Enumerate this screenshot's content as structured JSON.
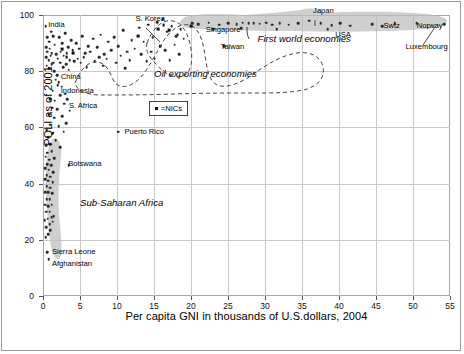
{
  "chart_data": {
    "type": "scatter",
    "title": "",
    "xlabel": "Per capita GNI in thousands of U.S.dollars, 2004",
    "ylabel": "PQLI as of 2001",
    "xlim": [
      0,
      55
    ],
    "ylim": [
      0,
      100
    ],
    "xticks": [
      0,
      5,
      10,
      15,
      20,
      25,
      30,
      35,
      40,
      45,
      50,
      55
    ],
    "yticks": [
      0,
      20,
      40,
      60,
      80,
      100
    ],
    "xticklabels": [
      "0",
      "5",
      "10",
      "15",
      "20",
      "25",
      "30",
      "35",
      "40",
      "45",
      "50",
      "55"
    ],
    "yticklabels": [
      "0",
      "20",
      "40",
      "60",
      "80",
      "100"
    ],
    "grid": true,
    "legend": {
      "position": "inside-center-left",
      "entries": [
        {
          "marker": "square",
          "label": "=NICs"
        }
      ]
    },
    "point_color": "#2a2a2a",
    "grid_color": "#c9c9c9",
    "blob_color": "#bdbdbd",
    "annotations": [
      {
        "text": "India",
        "x": 0.7,
        "y": 96.5
      },
      {
        "text": "S. Korea",
        "x": 12.5,
        "y": 98.5
      },
      {
        "text": "Japan",
        "x": 36.5,
        "y": 101.5
      },
      {
        "text": "Singapore",
        "x": 22.0,
        "y": 94.5
      },
      {
        "text": "USA",
        "x": 39.5,
        "y": 93.0
      },
      {
        "text": "Swtz",
        "x": 46.0,
        "y": 96.0
      },
      {
        "text": "Norway",
        "x": 50.5,
        "y": 96.0
      },
      {
        "text": "Taiwan",
        "x": 24.0,
        "y": 88.5
      },
      {
        "text": "Luxembourg",
        "x": 49.0,
        "y": 88.5
      },
      {
        "text": "China",
        "x": 2.4,
        "y": 78.0
      },
      {
        "text": "Indonesia",
        "x": 2.4,
        "y": 73.0
      },
      {
        "text": "S. Africa",
        "x": 3.5,
        "y": 67.5
      },
      {
        "text": "Puerto Rico",
        "x": 11.0,
        "y": 58.5
      },
      {
        "text": "Botswana",
        "x": 3.4,
        "y": 47.0
      },
      {
        "text": "Sierra Leone",
        "x": 1.2,
        "y": 15.5
      },
      {
        "text": "Afghanistan",
        "x": 1.2,
        "y": 11.5
      }
    ],
    "region_labels": [
      {
        "text": "First world economies",
        "x": 29.0,
        "y": 91.5
      },
      {
        "text": "Oil exporting economies",
        "x": 15.0,
        "y": 79.0
      },
      {
        "text": "Sub-Saharan Africa",
        "x": 5.0,
        "y": 33.0
      }
    ],
    "series": [
      {
        "name": "Countries",
        "points": [
          [
            0.35,
            96.0
          ],
          [
            0.55,
            92.0
          ],
          [
            0.8,
            90.5
          ],
          [
            1.1,
            94.0
          ],
          [
            1.4,
            92.5
          ],
          [
            0.4,
            88.5
          ],
          [
            0.6,
            87.0
          ],
          [
            0.9,
            88.0
          ],
          [
            1.2,
            86.5
          ],
          [
            1.6,
            89.5
          ],
          [
            0.45,
            85.0
          ],
          [
            0.75,
            84.0
          ],
          [
            1.05,
            85.5
          ],
          [
            1.35,
            83.0
          ],
          [
            1.8,
            86.0
          ],
          [
            0.5,
            82.0
          ],
          [
            0.85,
            81.0
          ],
          [
            1.15,
            82.5
          ],
          [
            1.5,
            80.0
          ],
          [
            2.0,
            84.5
          ],
          [
            2.2,
            92.0
          ],
          [
            2.6,
            90.0
          ],
          [
            3.0,
            93.5
          ],
          [
            3.4,
            88.5
          ],
          [
            3.8,
            91.0
          ],
          [
            2.4,
            87.0
          ],
          [
            2.8,
            85.5
          ],
          [
            3.2,
            86.5
          ],
          [
            3.6,
            84.0
          ],
          [
            4.0,
            87.5
          ],
          [
            2.3,
            83.0
          ],
          [
            2.7,
            81.5
          ],
          [
            3.1,
            82.5
          ],
          [
            3.5,
            80.5
          ],
          [
            4.2,
            83.5
          ],
          [
            4.5,
            90.0
          ],
          [
            4.9,
            88.0
          ],
          [
            5.3,
            92.5
          ],
          [
            5.7,
            86.5
          ],
          [
            6.1,
            89.0
          ],
          [
            4.7,
            84.5
          ],
          [
            5.1,
            83.0
          ],
          [
            5.5,
            85.0
          ],
          [
            5.9,
            81.5
          ],
          [
            6.4,
            87.0
          ],
          [
            6.8,
            91.5
          ],
          [
            7.3,
            88.5
          ],
          [
            7.8,
            93.0
          ],
          [
            8.3,
            86.0
          ],
          [
            8.8,
            90.5
          ],
          [
            7.0,
            83.5
          ],
          [
            7.6,
            85.0
          ],
          [
            8.1,
            82.0
          ],
          [
            8.6,
            84.5
          ],
          [
            9.2,
            87.5
          ],
          [
            9.6,
            92.0
          ],
          [
            10.2,
            89.0
          ],
          [
            10.8,
            94.5
          ],
          [
            11.4,
            87.0
          ],
          [
            12.0,
            91.0
          ],
          [
            9.9,
            83.0
          ],
          [
            10.5,
            85.5
          ],
          [
            11.1,
            81.0
          ],
          [
            11.7,
            84.0
          ],
          [
            12.4,
            88.0
          ],
          [
            13.0,
            95.5
          ],
          [
            13.6,
            90.5
          ],
          [
            14.2,
            96.5
          ],
          [
            14.8,
            92.0
          ],
          [
            15.4,
            97.5
          ],
          [
            13.3,
            86.0
          ],
          [
            14.0,
            83.5
          ],
          [
            14.6,
            87.0
          ],
          [
            15.1,
            84.5
          ],
          [
            15.8,
            89.0
          ],
          [
            16.2,
            98.5
          ],
          [
            16.8,
            94.0
          ],
          [
            17.4,
            96.0
          ],
          [
            18.0,
            92.5
          ],
          [
            18.6,
            95.0
          ],
          [
            16.5,
            87.5
          ],
          [
            17.1,
            84.0
          ],
          [
            17.8,
            89.5
          ],
          [
            18.4,
            86.0
          ],
          [
            19.0,
            91.5
          ],
          [
            1.9,
            78.5
          ],
          [
            2.1,
            76.0
          ],
          [
            2.5,
            74.5
          ],
          [
            3.0,
            72.0
          ],
          [
            3.3,
            70.0
          ],
          [
            1.7,
            77.0
          ],
          [
            2.0,
            75.0
          ],
          [
            2.3,
            71.5
          ],
          [
            2.9,
            68.5
          ],
          [
            3.6,
            66.0
          ],
          [
            1.3,
            73.0
          ],
          [
            1.6,
            69.5
          ],
          [
            1.9,
            66.5
          ],
          [
            2.6,
            64.0
          ],
          [
            3.1,
            61.5
          ],
          [
            1.0,
            70.0
          ],
          [
            1.25,
            67.0
          ],
          [
            1.55,
            63.5
          ],
          [
            2.1,
            60.5
          ],
          [
            2.8,
            58.5
          ],
          [
            0.8,
            64.5
          ],
          [
            1.0,
            61.0
          ],
          [
            1.3,
            58.0
          ],
          [
            1.7,
            55.5
          ],
          [
            2.3,
            53.0
          ],
          [
            0.5,
            59.0
          ],
          [
            0.7,
            56.5
          ],
          [
            0.95,
            54.0
          ],
          [
            1.2,
            51.5
          ],
          [
            1.5,
            49.0
          ],
          [
            0.4,
            53.5
          ],
          [
            0.6,
            51.0
          ],
          [
            0.85,
            48.5
          ],
          [
            1.1,
            46.5
          ],
          [
            1.4,
            44.0
          ],
          [
            0.35,
            49.5
          ],
          [
            0.55,
            47.0
          ],
          [
            0.75,
            45.0
          ],
          [
            1.0,
            42.5
          ],
          [
            1.3,
            40.5
          ],
          [
            0.3,
            45.5
          ],
          [
            0.5,
            43.0
          ],
          [
            0.7,
            41.0
          ],
          [
            0.95,
            38.5
          ],
          [
            1.25,
            36.5
          ],
          [
            0.3,
            41.5
          ],
          [
            0.5,
            39.0
          ],
          [
            0.7,
            37.0
          ],
          [
            0.9,
            34.5
          ],
          [
            1.2,
            32.5
          ],
          [
            0.28,
            37.0
          ],
          [
            0.48,
            34.5
          ],
          [
            0.68,
            32.0
          ],
          [
            0.88,
            30.0
          ],
          [
            1.15,
            28.0
          ],
          [
            0.26,
            32.5
          ],
          [
            0.46,
            30.0
          ],
          [
            0.66,
            27.5
          ],
          [
            0.9,
            25.5
          ],
          [
            1.3,
            26.5
          ],
          [
            0.25,
            27.0
          ],
          [
            0.45,
            24.5
          ],
          [
            0.7,
            22.0
          ],
          [
            0.95,
            23.5
          ],
          [
            1.45,
            28.5
          ],
          [
            0.35,
            21.0
          ],
          [
            0.55,
            15.5
          ],
          [
            0.75,
            13.0
          ],
          [
            3.5,
            46.5
          ],
          [
            10.2,
            58.5
          ]
        ]
      },
      {
        "name": "NICs",
        "points": [
          [
            2.6,
            88.0
          ],
          [
            3.2,
            85.0
          ],
          [
            4.1,
            86.5
          ],
          [
            12.9,
            92.5
          ],
          [
            15.6,
            95.0
          ],
          [
            16.3,
            96.5
          ],
          [
            17.0,
            94.5
          ],
          [
            18.2,
            93.0
          ],
          [
            20.0,
            96.0
          ]
        ]
      },
      {
        "name": "FirstWorld",
        "points": [
          [
            20.2,
            97.0
          ],
          [
            21.0,
            96.8
          ],
          [
            22.4,
            97.2
          ],
          [
            23.8,
            96.5
          ],
          [
            25.0,
            97.0
          ],
          [
            26.2,
            96.8
          ],
          [
            27.0,
            97.2
          ],
          [
            27.8,
            97.0
          ],
          [
            28.5,
            97.1
          ],
          [
            29.3,
            96.9
          ],
          [
            30.2,
            97.2
          ],
          [
            31.0,
            96.6
          ],
          [
            32.0,
            97.0
          ],
          [
            33.2,
            96.5
          ],
          [
            34.5,
            97.1
          ],
          [
            36.0,
            98.0
          ],
          [
            37.5,
            97.0
          ],
          [
            39.0,
            96.4
          ],
          [
            40.2,
            97.0
          ],
          [
            41.5,
            96.2
          ],
          [
            44.5,
            96.8
          ],
          [
            47.5,
            97.0
          ],
          [
            50.5,
            97.0
          ],
          [
            54.2,
            96.8
          ],
          [
            23.0,
            95.0
          ],
          [
            26.8,
            95.2
          ],
          [
            31.6,
            95.0
          ],
          [
            38.5,
            95.0
          ],
          [
            45.8,
            96.0
          ],
          [
            24.5,
            89.0
          ],
          [
            52.0,
            95.5
          ]
        ]
      }
    ]
  },
  "figure": {
    "axis_font_size": "11px",
    "tick_font_size": "8.5px",
    "annotation_font_size": "7.6px",
    "region_font_size": "9.6px"
  }
}
